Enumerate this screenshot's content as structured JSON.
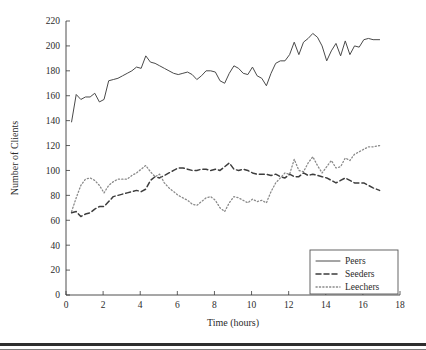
{
  "figure": {
    "background_color": "#ffffff",
    "bottom_rule_color": "#2e2e2e"
  },
  "chart_data": {
    "type": "line",
    "title": "",
    "xlabel": "Time (hours)",
    "ylabel": "Number of Clients",
    "xlim": [
      0,
      18
    ],
    "ylim": [
      0,
      220
    ],
    "xticks": [
      0,
      2,
      4,
      6,
      8,
      10,
      12,
      14,
      16,
      18
    ],
    "xticklabels": [
      "0",
      "2",
      "4",
      "6",
      "8",
      "10",
      "12",
      "14",
      "16",
      "18"
    ],
    "yticks": [
      0,
      20,
      40,
      60,
      80,
      100,
      120,
      140,
      160,
      180,
      200,
      220
    ],
    "yticklabels": [
      "0",
      "20",
      "40",
      "60",
      "80",
      "100",
      "120",
      "140",
      "160",
      "180",
      "200",
      "220"
    ],
    "grid": false,
    "legend_position": "lower right",
    "legend_entries": [
      "Peers",
      "Seeders",
      "Leechers"
    ],
    "x": [
      0.3,
      0.55,
      0.8,
      1.05,
      1.3,
      1.55,
      1.8,
      2.05,
      2.3,
      2.55,
      2.8,
      3.05,
      3.3,
      3.55,
      3.8,
      4.05,
      4.3,
      4.55,
      4.8,
      5.05,
      5.3,
      5.55,
      5.8,
      6.05,
      6.3,
      6.55,
      6.8,
      7.05,
      7.3,
      7.55,
      7.8,
      8.05,
      8.3,
      8.55,
      8.8,
      9.05,
      9.3,
      9.55,
      9.8,
      10.05,
      10.3,
      10.55,
      10.8,
      11.05,
      11.3,
      11.55,
      11.8,
      12.05,
      12.3,
      12.55,
      12.8,
      13.05,
      13.3,
      13.55,
      13.8,
      14.05,
      14.3,
      14.55,
      14.8,
      15.05,
      15.3,
      15.55,
      15.8,
      16.05,
      16.3,
      16.55,
      16.9
    ],
    "series": [
      {
        "name": "Peers",
        "style": "solid",
        "color": "#4a4a4a",
        "values": [
          139,
          161,
          157,
          159,
          159,
          162,
          155,
          157,
          172,
          173,
          174,
          176,
          178,
          180,
          183,
          182,
          192,
          187,
          186,
          184,
          182,
          180,
          178,
          177,
          178,
          179,
          177,
          173,
          176,
          180,
          180,
          179,
          172,
          170,
          178,
          184,
          182,
          178,
          177,
          183,
          176,
          174,
          168,
          178,
          186,
          188,
          188,
          193,
          203,
          193,
          203,
          206,
          210,
          207,
          200,
          188,
          196,
          202,
          192,
          204,
          193,
          200,
          199,
          205,
          206,
          205,
          205
        ]
      },
      {
        "name": "Seeders",
        "style": "dashed",
        "color": "#3d3d3d",
        "values": [
          66,
          67,
          63,
          65,
          66,
          69,
          71,
          71,
          75,
          79,
          80,
          81,
          82,
          83,
          84,
          83,
          85,
          92,
          95,
          94,
          96,
          98,
          100,
          102,
          102,
          101,
          100,
          100,
          101,
          101,
          100,
          101,
          100,
          103,
          106,
          101,
          100,
          101,
          100,
          98,
          97,
          97,
          97,
          96,
          97,
          95,
          94,
          97,
          95,
          95,
          98,
          96,
          97,
          96,
          95,
          94,
          92,
          90,
          92,
          94,
          92,
          90,
          90,
          90,
          88,
          86,
          84
        ]
      },
      {
        "name": "Leechers",
        "style": "dotted",
        "color": "#8a8a8a",
        "values": [
          67,
          78,
          88,
          93,
          94,
          92,
          88,
          82,
          88,
          91,
          93,
          93,
          93,
          96,
          98,
          101,
          104,
          99,
          95,
          97,
          90,
          86,
          83,
          80,
          78,
          76,
          73,
          72,
          75,
          78,
          79,
          76,
          70,
          67,
          74,
          79,
          78,
          76,
          74,
          77,
          75,
          76,
          74,
          83,
          90,
          94,
          98,
          97,
          109,
          100,
          99,
          106,
          111,
          104,
          98,
          103,
          108,
          102,
          103,
          110,
          108,
          113,
          115,
          117,
          119,
          119,
          120
        ]
      }
    ]
  }
}
